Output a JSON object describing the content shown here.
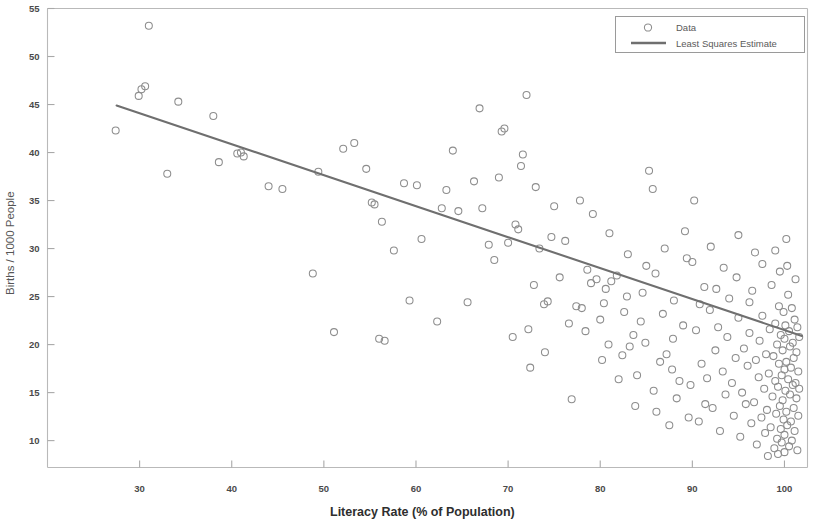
{
  "chart_data": {
    "type": "scatter",
    "title": "",
    "xlabel": "Literacy Rate (% of Population)",
    "ylabel": "Births / 1000 People",
    "xlim": [
      20,
      102.5
    ],
    "ylim": [
      7.2,
      55
    ],
    "grid": false,
    "legend_position": "top-right",
    "xticks": [
      30,
      40,
      50,
      60,
      70,
      80,
      90,
      100
    ],
    "xtick_labels": [
      "30",
      "40",
      "50",
      "60",
      "70",
      "80",
      "90",
      "100"
    ],
    "yticks": [
      10,
      15,
      20,
      25,
      30,
      35,
      40,
      45,
      50,
      55
    ],
    "ytick_labels": [
      "10",
      "15",
      "20",
      "25",
      "30",
      "35",
      "40",
      "45",
      "50",
      "55"
    ],
    "marker": "open-circle",
    "marker_color": "#8d8d8d",
    "line_color": "#6f6f6f",
    "series": [
      {
        "name": "Data",
        "type": "scatter",
        "points": [
          [
            27.4,
            42.3
          ],
          [
            31.0,
            53.2
          ],
          [
            30.2,
            46.6
          ],
          [
            30.6,
            46.9
          ],
          [
            29.9,
            45.9
          ],
          [
            33.0,
            37.8
          ],
          [
            34.2,
            45.3
          ],
          [
            38.0,
            43.8
          ],
          [
            38.6,
            39.0
          ],
          [
            41.0,
            40.0
          ],
          [
            41.3,
            39.6
          ],
          [
            40.6,
            39.9
          ],
          [
            44.0,
            36.5
          ],
          [
            45.5,
            36.2
          ],
          [
            48.8,
            27.4
          ],
          [
            49.4,
            38.0
          ],
          [
            52.1,
            40.4
          ],
          [
            53.3,
            41.0
          ],
          [
            51.1,
            21.3
          ],
          [
            54.6,
            38.3
          ],
          [
            55.2,
            34.8
          ],
          [
            55.5,
            34.6
          ],
          [
            56.3,
            32.8
          ],
          [
            56.0,
            20.6
          ],
          [
            56.6,
            20.4
          ],
          [
            57.6,
            29.8
          ],
          [
            58.7,
            36.8
          ],
          [
            59.3,
            24.6
          ],
          [
            60.6,
            31.0
          ],
          [
            60.1,
            36.6
          ],
          [
            62.3,
            22.4
          ],
          [
            62.8,
            34.2
          ],
          [
            63.3,
            36.1
          ],
          [
            64.0,
            40.2
          ],
          [
            64.6,
            33.9
          ],
          [
            65.6,
            24.4
          ],
          [
            66.3,
            37.0
          ],
          [
            66.9,
            44.6
          ],
          [
            67.2,
            34.2
          ],
          [
            67.9,
            30.4
          ],
          [
            68.5,
            28.8
          ],
          [
            69.3,
            42.2
          ],
          [
            69.6,
            42.5
          ],
          [
            70.0,
            30.6
          ],
          [
            70.5,
            20.8
          ],
          [
            70.8,
            32.5
          ],
          [
            71.1,
            32.0
          ],
          [
            71.6,
            39.8
          ],
          [
            72.0,
            46.0
          ],
          [
            72.4,
            17.6
          ],
          [
            72.8,
            26.2
          ],
          [
            73.4,
            30.0
          ],
          [
            73.9,
            24.2
          ],
          [
            74.3,
            24.5
          ],
          [
            74.7,
            31.2
          ],
          [
            75.6,
            27.0
          ],
          [
            76.2,
            30.8
          ],
          [
            76.9,
            14.3
          ],
          [
            77.4,
            24.0
          ],
          [
            78.0,
            23.8
          ],
          [
            78.6,
            27.8
          ],
          [
            79.0,
            26.4
          ],
          [
            79.6,
            26.8
          ],
          [
            80.0,
            22.6
          ],
          [
            80.4,
            24.3
          ],
          [
            80.9,
            20.0
          ],
          [
            81.2,
            26.6
          ],
          [
            81.8,
            27.2
          ],
          [
            82.4,
            18.9
          ],
          [
            82.9,
            25.0
          ],
          [
            83.2,
            19.8
          ],
          [
            83.6,
            21.0
          ],
          [
            84.0,
            16.8
          ],
          [
            84.4,
            22.4
          ],
          [
            84.9,
            20.2
          ],
          [
            85.3,
            38.1
          ],
          [
            85.7,
            36.2
          ],
          [
            86.1,
            13.0
          ],
          [
            86.5,
            18.2
          ],
          [
            86.8,
            23.2
          ],
          [
            87.2,
            19.0
          ],
          [
            87.5,
            11.6
          ],
          [
            87.9,
            20.6
          ],
          [
            88.3,
            14.4
          ],
          [
            88.6,
            16.2
          ],
          [
            89.0,
            22.0
          ],
          [
            89.4,
            29.0
          ],
          [
            89.8,
            15.8
          ],
          [
            90.2,
            35.0
          ],
          [
            90.4,
            21.5
          ],
          [
            90.7,
            12.0
          ],
          [
            91.0,
            18.0
          ],
          [
            91.3,
            26.0
          ],
          [
            91.6,
            16.5
          ],
          [
            91.9,
            23.6
          ],
          [
            92.2,
            13.4
          ],
          [
            92.5,
            19.4
          ],
          [
            92.8,
            21.8
          ],
          [
            93.0,
            11.0
          ],
          [
            93.3,
            17.2
          ],
          [
            93.6,
            14.8
          ],
          [
            93.8,
            20.8
          ],
          [
            94.0,
            24.8
          ],
          [
            94.3,
            16.0
          ],
          [
            94.5,
            12.6
          ],
          [
            94.7,
            18.6
          ],
          [
            95.0,
            22.8
          ],
          [
            95.2,
            10.4
          ],
          [
            95.4,
            15.0
          ],
          [
            95.6,
            19.6
          ],
          [
            95.8,
            13.8
          ],
          [
            96.0,
            17.8
          ],
          [
            96.2,
            21.2
          ],
          [
            96.4,
            11.8
          ],
          [
            96.5,
            25.6
          ],
          [
            96.7,
            14.0
          ],
          [
            96.9,
            18.4
          ],
          [
            97.0,
            9.6
          ],
          [
            97.2,
            16.6
          ],
          [
            97.3,
            20.4
          ],
          [
            97.5,
            12.4
          ],
          [
            97.6,
            23.0
          ],
          [
            97.8,
            15.4
          ],
          [
            97.9,
            10.8
          ],
          [
            98.0,
            19.0
          ],
          [
            98.1,
            13.2
          ],
          [
            98.3,
            17.0
          ],
          [
            98.4,
            21.6
          ],
          [
            98.5,
            11.4
          ],
          [
            98.6,
            26.2
          ],
          [
            98.7,
            14.6
          ],
          [
            98.8,
            18.8
          ],
          [
            98.9,
            9.2
          ],
          [
            99.0,
            16.2
          ],
          [
            99.0,
            22.2
          ],
          [
            99.1,
            12.8
          ],
          [
            99.2,
            20.0
          ],
          [
            99.2,
            10.2
          ],
          [
            99.3,
            15.6
          ],
          [
            99.4,
            24.0
          ],
          [
            99.4,
            18.0
          ],
          [
            99.5,
            13.6
          ],
          [
            99.5,
            27.6
          ],
          [
            99.6,
            11.2
          ],
          [
            99.6,
            21.0
          ],
          [
            99.7,
            16.8
          ],
          [
            99.7,
            9.8
          ],
          [
            99.8,
            19.4
          ],
          [
            99.8,
            14.2
          ],
          [
            99.9,
            23.4
          ],
          [
            99.9,
            12.2
          ],
          [
            100.0,
            17.4
          ],
          [
            100.0,
            10.6
          ],
          [
            100.0,
            20.6
          ],
          [
            100.1,
            15.2
          ],
          [
            100.1,
            22.0
          ],
          [
            100.2,
            13.0
          ],
          [
            100.2,
            18.2
          ],
          [
            100.3,
            28.2
          ],
          [
            100.3,
            11.6
          ],
          [
            100.4,
            16.4
          ],
          [
            100.4,
            25.2
          ],
          [
            100.5,
            9.4
          ],
          [
            100.5,
            21.4
          ],
          [
            100.6,
            14.8
          ],
          [
            100.6,
            19.8
          ],
          [
            100.7,
            12.0
          ],
          [
            100.7,
            17.6
          ],
          [
            100.8,
            23.8
          ],
          [
            100.8,
            10.0
          ],
          [
            100.9,
            15.8
          ],
          [
            100.9,
            20.2
          ],
          [
            101.0,
            13.4
          ],
          [
            101.0,
            18.6
          ],
          [
            101.1,
            22.6
          ],
          [
            101.1,
            11.0
          ],
          [
            101.2,
            16.0
          ],
          [
            101.2,
            26.8
          ],
          [
            101.3,
            19.2
          ],
          [
            101.3,
            14.4
          ],
          [
            101.4,
            21.8
          ],
          [
            101.4,
            9.0
          ],
          [
            101.5,
            17.2
          ],
          [
            101.5,
            12.6
          ],
          [
            101.6,
            20.8
          ],
          [
            101.6,
            15.4
          ],
          [
            99.3,
            8.6
          ],
          [
            98.2,
            8.4
          ],
          [
            100.0,
            8.8
          ],
          [
            97.6,
            28.4
          ],
          [
            96.8,
            29.6
          ],
          [
            95.0,
            31.4
          ],
          [
            93.4,
            28.0
          ],
          [
            92.0,
            30.2
          ],
          [
            90.0,
            28.6
          ],
          [
            89.2,
            31.8
          ],
          [
            87.0,
            30.0
          ],
          [
            85.0,
            28.2
          ],
          [
            83.0,
            29.4
          ],
          [
            81.0,
            31.6
          ],
          [
            79.2,
            33.6
          ],
          [
            77.8,
            35.0
          ],
          [
            75.0,
            34.4
          ],
          [
            73.0,
            36.4
          ],
          [
            71.4,
            38.6
          ],
          [
            69.0,
            37.4
          ],
          [
            88.0,
            24.6
          ],
          [
            86.0,
            27.4
          ],
          [
            84.6,
            25.4
          ],
          [
            82.6,
            23.4
          ],
          [
            80.6,
            25.8
          ],
          [
            78.4,
            21.4
          ],
          [
            76.6,
            22.2
          ],
          [
            74.0,
            19.2
          ],
          [
            72.2,
            21.6
          ],
          [
            90.8,
            24.2
          ],
          [
            92.6,
            25.8
          ],
          [
            94.8,
            27.0
          ],
          [
            96.2,
            24.4
          ],
          [
            91.4,
            13.8
          ],
          [
            89.6,
            12.4
          ],
          [
            87.8,
            17.4
          ],
          [
            85.8,
            15.2
          ],
          [
            83.8,
            13.6
          ],
          [
            82.0,
            16.4
          ],
          [
            80.2,
            18.4
          ],
          [
            99.0,
            29.8
          ],
          [
            100.2,
            31.0
          ]
        ]
      },
      {
        "name": "Least Squares Estimate",
        "type": "line",
        "endpoints": [
          [
            27.5,
            44.9
          ],
          [
            101.9,
            20.9
          ]
        ],
        "slope": -0.3226,
        "intercept": 53.77
      }
    ]
  },
  "legend": {
    "entries": [
      {
        "label": "Data",
        "marker": "open-circle"
      },
      {
        "label": "Least Squares Estimate",
        "marker": "line"
      }
    ]
  },
  "axes": {
    "x_title": "Literacy Rate (% of Population)",
    "y_title": "Births / 1000 People"
  }
}
